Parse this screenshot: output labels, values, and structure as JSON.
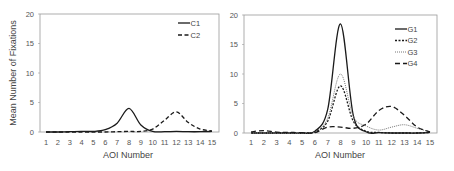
{
  "chart_data": [
    {
      "type": "line",
      "title": "",
      "xlabel": "AOI Number",
      "ylabel": "Mean Number of Fixations",
      "ylim": [
        0,
        20
      ],
      "yticks": [
        0,
        5,
        10,
        15,
        20
      ],
      "x": [
        1,
        2,
        3,
        4,
        5,
        6,
        7,
        8,
        9,
        10,
        11,
        12,
        13,
        14,
        15
      ],
      "legend_position": "top-right",
      "grid": false,
      "series": [
        {
          "name": "C1",
          "style": "solid",
          "values": [
            0,
            0,
            0.05,
            0.1,
            0.1,
            0.4,
            1.5,
            4.0,
            1.2,
            0.1,
            0.05,
            0.1,
            0.05,
            0.05,
            0.1
          ]
        },
        {
          "name": "C2",
          "style": "dashed",
          "values": [
            0,
            0,
            0,
            0,
            0,
            0,
            0.05,
            0.1,
            0.1,
            0.5,
            2.0,
            3.4,
            1.6,
            0.5,
            0.2
          ]
        }
      ]
    },
    {
      "type": "line",
      "title": "",
      "xlabel": "AOI Number",
      "ylabel": "",
      "ylim": [
        0,
        20
      ],
      "yticks": [
        0,
        5,
        10,
        15,
        20
      ],
      "x": [
        1,
        2,
        3,
        4,
        5,
        6,
        7,
        8,
        9,
        10,
        11,
        12,
        13,
        14,
        15
      ],
      "legend_position": "top-right",
      "grid": false,
      "series": [
        {
          "name": "G1",
          "style": "solid",
          "values": [
            0,
            0,
            0,
            0,
            0,
            0.3,
            4.0,
            18.5,
            3.0,
            0.2,
            0.05,
            0,
            0,
            0,
            0.1
          ]
        },
        {
          "name": "G2",
          "style": "short-dash",
          "values": [
            0,
            0,
            0,
            0,
            0,
            0.2,
            2.0,
            8.0,
            2.0,
            0.3,
            0.1,
            0,
            0,
            0,
            0.1
          ]
        },
        {
          "name": "G3",
          "style": "dotted",
          "values": [
            0,
            0,
            0,
            0,
            0,
            0.2,
            2.5,
            10.0,
            2.8,
            1.2,
            0.5,
            1.0,
            1.4,
            0.8,
            0.2
          ]
        },
        {
          "name": "G4",
          "style": "long-dash",
          "values": [
            0.2,
            0.4,
            0.15,
            0.1,
            0.05,
            0.05,
            1.0,
            1.0,
            0.8,
            1.5,
            3.8,
            4.5,
            3.0,
            1.0,
            0.2
          ]
        }
      ]
    }
  ]
}
